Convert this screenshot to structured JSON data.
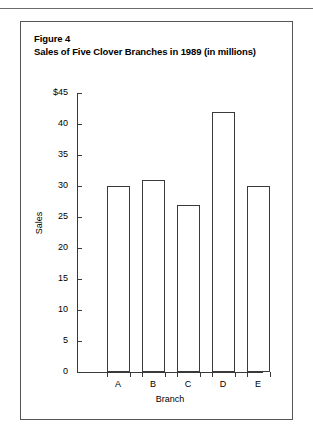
{
  "figure": {
    "label": "Figure 4",
    "caption": "Sales of Five Clover Branches in 1989 (in millions)"
  },
  "colors": {
    "page_background": "#ffffff",
    "border": "#555555",
    "rule": "#6b6b6b",
    "axis": "#3a3a3a",
    "bar_fill": "#ffffff",
    "bar_stroke": "#3a3a3a",
    "text": "#000000"
  },
  "chart_data": {
    "type": "bar",
    "title": "Sales of Five Clover Branches in 1989 (in millions)",
    "categories": [
      "A",
      "B",
      "C",
      "D",
      "E"
    ],
    "values": [
      30,
      31,
      27,
      42,
      30
    ],
    "xlabel": "Branch",
    "ylabel": "Sales",
    "ylim": [
      0,
      45
    ],
    "ytick_values": [
      0,
      5,
      10,
      15,
      20,
      25,
      30,
      35,
      40,
      45
    ],
    "ytick_labels": [
      "0",
      "5",
      "10",
      "15",
      "20",
      "25",
      "30",
      "35",
      "40",
      "$45"
    ],
    "grid": false,
    "legend": null
  }
}
